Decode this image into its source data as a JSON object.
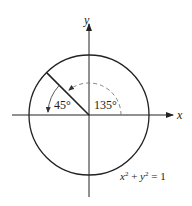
{
  "diagram": {
    "type": "unit-circle",
    "equation": {
      "x": "x",
      "sup1": "2",
      "plus": " + ",
      "y": "y",
      "sup2": "2",
      "eq": " = 1"
    },
    "axes": {
      "x_label": "x",
      "y_label": "y"
    },
    "angles": [
      {
        "label": "45°",
        "from_deg": 180,
        "to_deg": 135,
        "style": "solid"
      },
      {
        "label": "135°",
        "from_deg": 0,
        "to_deg": 135,
        "style": "dashed"
      }
    ],
    "ray_angle_deg": 135,
    "colors": {
      "stroke": "#222222",
      "dashed": "#777777"
    }
  }
}
